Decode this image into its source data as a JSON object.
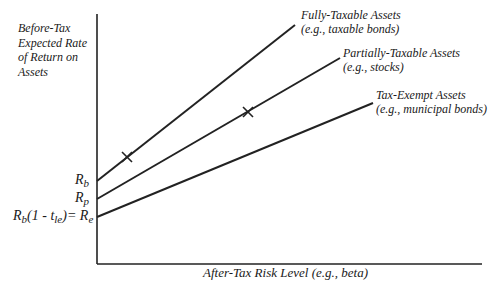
{
  "diagram": {
    "y_axis_label": "Before-Tax Expected Rate of Return on Assets",
    "x_axis_label": "After-Tax Risk Level (e.g., beta)",
    "intercepts": {
      "rb": {
        "main": "R",
        "sub": "b"
      },
      "rp": {
        "main": "R",
        "sub": "p"
      },
      "re": {
        "prefix": "R",
        "prefix_sub": "b",
        "middle": "(1 - t",
        "middle_sub": "le",
        "suffix": ")= R",
        "suffix_sub": "e"
      }
    },
    "lines": [
      {
        "name": "Fully-Taxable Assets",
        "example": "(e.g., taxable bonds)",
        "intercept": "Rb"
      },
      {
        "name": "Partially-Taxable Assets",
        "example": "(e.g., stocks)",
        "intercept": "Rp"
      },
      {
        "name": "Tax-Exempt Assets",
        "example": "(e.g., municipal bonds)",
        "intercept": "Re"
      }
    ],
    "markers": [
      "X",
      "X"
    ]
  }
}
